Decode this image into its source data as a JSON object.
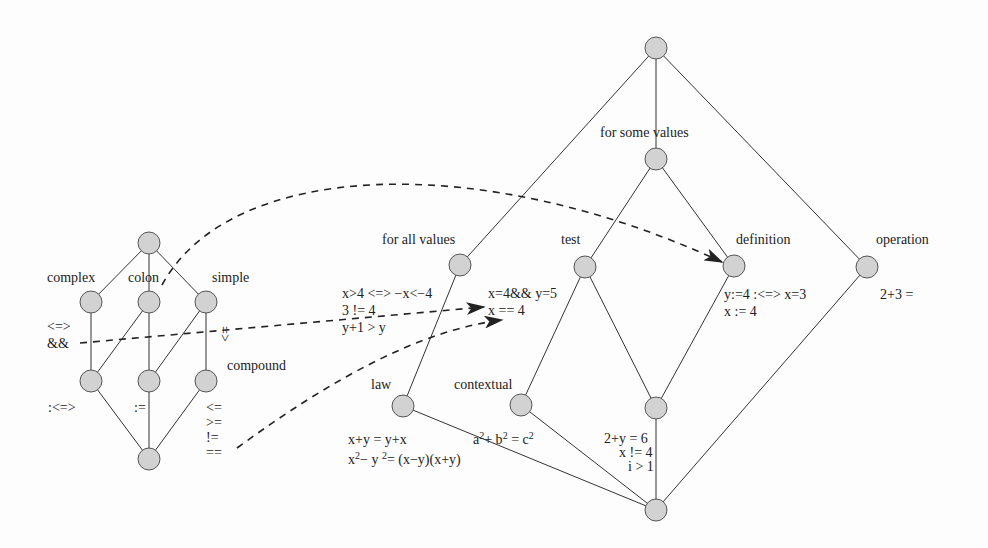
{
  "colors": {
    "node_fill": "#d2d2d2",
    "node_stroke": "#555555",
    "edge": "#333333",
    "dash": "#222222"
  },
  "left_lattice": {
    "nodes": [
      {
        "id": "top",
        "x": 149,
        "y": 243
      },
      {
        "id": "complex",
        "x": 91,
        "y": 302
      },
      {
        "id": "colon",
        "x": 149,
        "y": 302
      },
      {
        "id": "simple",
        "x": 206,
        "y": 302
      },
      {
        "id": "m1",
        "x": 91,
        "y": 381
      },
      {
        "id": "m2",
        "x": 149,
        "y": 381
      },
      {
        "id": "compound",
        "x": 206,
        "y": 381
      },
      {
        "id": "bottom",
        "x": 149,
        "y": 459
      }
    ],
    "labels": {
      "complex": "complex",
      "colon": "colon",
      "simple": "simple",
      "compound": "compound",
      "complex_ops_1": "<=>",
      "complex_ops_2": "&&",
      "simple_rot": "<=",
      "m1_op": ":<=>",
      "m2_op": ":=",
      "compound_ops": [
        "<=",
        ">=",
        "!=",
        "=="
      ]
    }
  },
  "right_lattice": {
    "labels": {
      "for_some_values": "for some values",
      "for_all_values": "for all values",
      "test": "test",
      "definition": "definition",
      "operation": "operation",
      "law": "law",
      "contextual": "contextual"
    },
    "examples": {
      "for_all_1": "x>4 <=> −x<−4",
      "for_all_2": "3 != 4",
      "for_all_3": "y+1 > y",
      "test_1": "x=4&& y=5",
      "test_2": "x == 4",
      "definition_1": "y:=4 :<=> x=3",
      "definition_2": "x := 4",
      "operation_1": "2+3 =",
      "law_1": "x+y = y+x",
      "law_2_a": "x",
      "law_2_b": "2",
      "law_2_c": "− y ",
      "law_2_d": "2",
      "law_2_e": "= (x−y)(x+y)",
      "contextual_a": "a",
      "contextual_b": "2",
      "contextual_c": "+ b",
      "contextual_d": "2",
      "contextual_e": " = c",
      "contextual_f": "2",
      "inner_1": "2+y = 6",
      "inner_2": "x != 4",
      "inner_3": "i > 1"
    }
  }
}
